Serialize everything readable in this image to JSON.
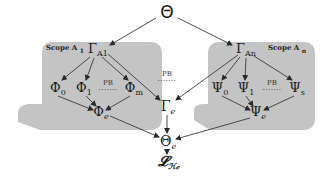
{
  "diagram": {
    "root": {
      "symbol": "Θ"
    },
    "scopes": [
      {
        "label": "Scope A",
        "label_sub": "1",
        "gamma": {
          "symbol": "Γ",
          "sub": "A1"
        },
        "children": [
          {
            "symbol": "Φ",
            "sub": "0"
          },
          {
            "symbol": "Φ",
            "sub": "1"
          },
          {
            "symbol": "Φ",
            "sub": "m"
          }
        ],
        "pb": {
          "label": "PB",
          "dots": "·······"
        },
        "aggregate": {
          "symbol": "Φ",
          "sub": "e"
        }
      },
      {
        "label": "Scope A",
        "label_sub": "n",
        "gamma": {
          "symbol": "Γ",
          "sub": "An"
        },
        "children": [
          {
            "symbol": "Ψ",
            "sub": "0"
          },
          {
            "symbol": "Ψ",
            "sub": "1"
          },
          {
            "symbol": "Ψ",
            "sub": "s"
          }
        ],
        "pb": {
          "label": "PB",
          "dots": "·······"
        },
        "aggregate": {
          "symbol": "Ψ",
          "sub": "e"
        }
      }
    ],
    "middle": {
      "pb": {
        "label": "PB",
        "dots": "·······"
      },
      "gamma_e": {
        "symbol": "Γ",
        "sub": "e"
      }
    },
    "theta_e": {
      "symbol": "Θ",
      "sub": "e"
    },
    "loss": {
      "symbol": "𝓛",
      "sub": "ℋ𝒸"
    },
    "colors": {
      "scope_fill": "#c4c4c4",
      "arrow": "#3a3a3a",
      "background": "#ffffff"
    }
  }
}
